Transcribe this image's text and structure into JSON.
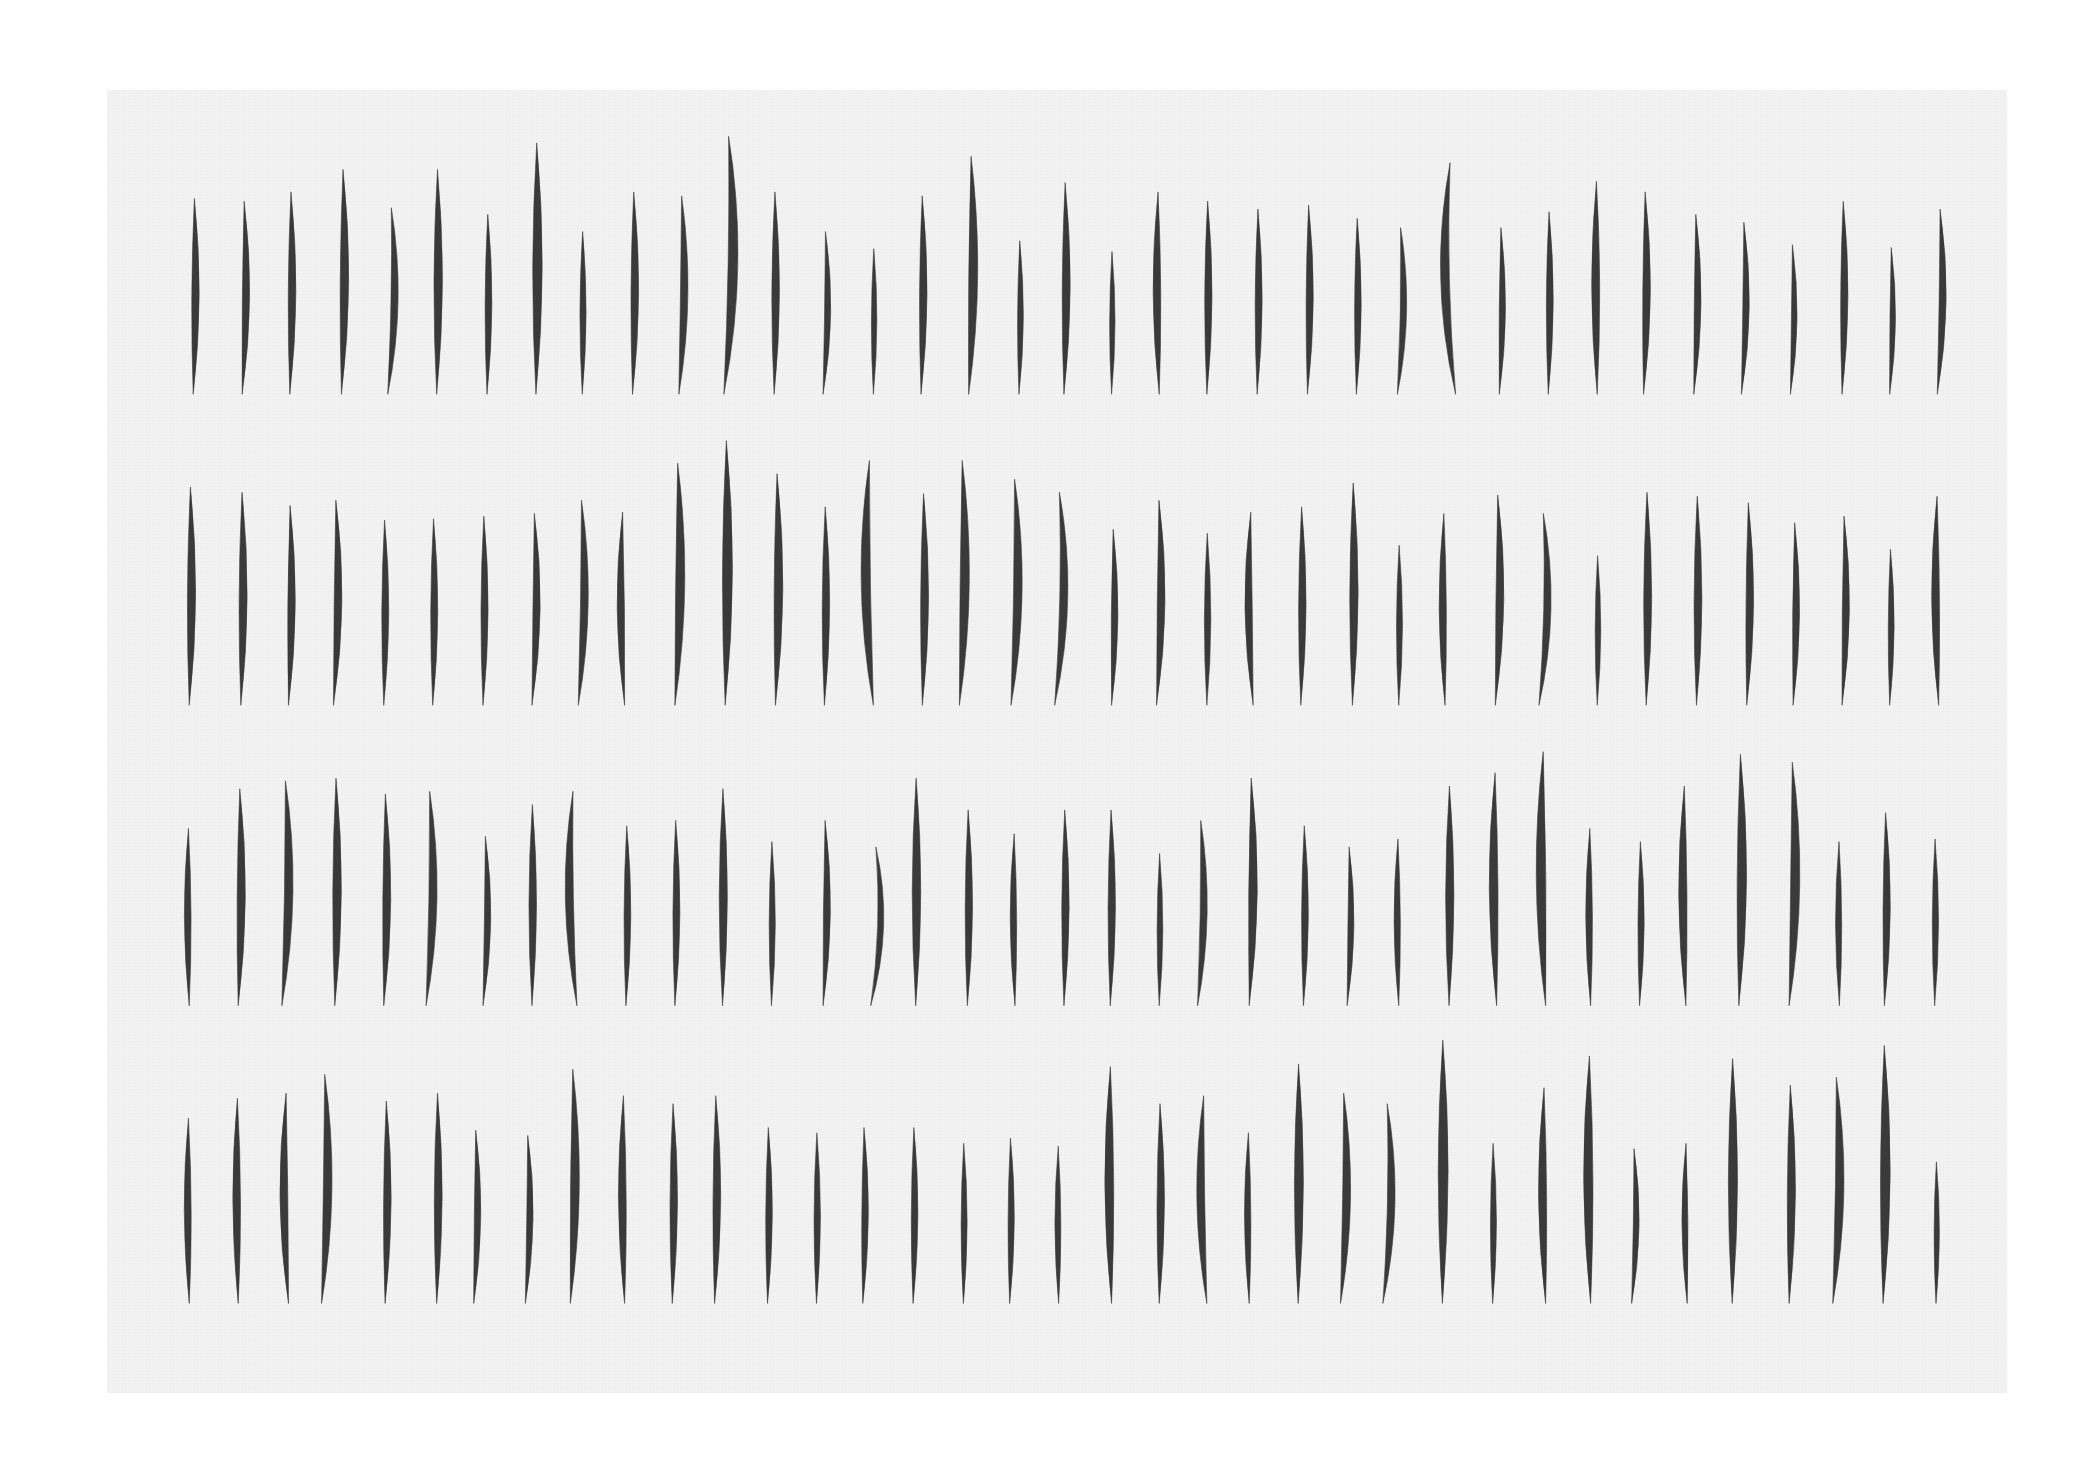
{
  "artwork": {
    "paper": {
      "x": 107,
      "y": 90,
      "width": 1900,
      "height": 1303,
      "color": "#f3f3f3"
    },
    "stroke_color": "#3a3a3a",
    "scale_from_overview": 1.3233,
    "rows": [
      {
        "bottom": 298,
        "strokes": [
          [
            146,
            150,
            3
          ],
          [
            183,
            152,
            5
          ],
          [
            219,
            145,
            3
          ],
          [
            258,
            128,
            4
          ],
          [
            293,
            157,
            9
          ],
          [
            330,
            128,
            2
          ],
          [
            368,
            162,
            2
          ],
          [
            405,
            108,
            2
          ],
          [
            440,
            175,
            1
          ],
          [
            478,
            145,
            3
          ],
          [
            513,
            148,
            7
          ],
          [
            547,
            103,
            12
          ],
          [
            585,
            145,
            2
          ],
          [
            622,
            175,
            6
          ],
          [
            660,
            188,
            1
          ],
          [
            696,
            148,
            3
          ],
          [
            732,
            118,
            6
          ],
          [
            770,
            182,
            2
          ],
          [
            804,
            138,
            3
          ],
          [
            840,
            190,
            1
          ],
          [
            876,
            145,
            -3
          ],
          [
            912,
            152,
            2
          ],
          [
            950,
            158,
            2
          ],
          [
            988,
            155,
            3
          ],
          [
            1025,
            165,
            2
          ],
          [
            1056,
            172,
            8
          ],
          [
            1100,
            123,
            -14
          ],
          [
            1133,
            172,
            4
          ],
          [
            1170,
            160,
            2
          ],
          [
            1207,
            137,
            -2
          ],
          [
            1242,
            145,
            4
          ],
          [
            1280,
            162,
            5
          ],
          [
            1316,
            168,
            6
          ],
          [
            1353,
            185,
            5
          ],
          [
            1392,
            152,
            3
          ],
          [
            1428,
            187,
            4
          ],
          [
            1464,
            158,
            7
          ]
        ]
      },
      {
        "bottom": 533,
        "strokes": [
          [
            143,
            368,
            3
          ],
          [
            182,
            372,
            3
          ],
          [
            218,
            382,
            4
          ],
          [
            252,
            378,
            6
          ],
          [
            290,
            393,
            2
          ],
          [
            327,
            392,
            2
          ],
          [
            365,
            390,
            2
          ],
          [
            402,
            388,
            6
          ],
          [
            437,
            378,
            8
          ],
          [
            472,
            387,
            -5
          ],
          [
            510,
            350,
            7
          ],
          [
            548,
            333,
            3
          ],
          [
            586,
            358,
            4
          ],
          [
            623,
            383,
            2
          ],
          [
            660,
            348,
            -10
          ],
          [
            697,
            373,
            3
          ],
          [
            725,
            348,
            7
          ],
          [
            764,
            362,
            9
          ],
          [
            797,
            372,
            12
          ],
          [
            840,
            400,
            4
          ],
          [
            874,
            378,
            6
          ],
          [
            912,
            403,
            1
          ],
          [
            947,
            387,
            -6
          ],
          [
            983,
            383,
            2
          ],
          [
            1022,
            365,
            2
          ],
          [
            1057,
            412,
            1
          ],
          [
            1092,
            388,
            -3
          ],
          [
            1130,
            374,
            6
          ],
          [
            1163,
            388,
            11
          ],
          [
            1207,
            420,
            1
          ],
          [
            1244,
            372,
            2
          ],
          [
            1282,
            375,
            2
          ],
          [
            1320,
            380,
            4
          ],
          [
            1355,
            395,
            4
          ],
          [
            1392,
            390,
            5
          ],
          [
            1428,
            415,
            2
          ],
          [
            1465,
            375,
            -4
          ]
        ]
      },
      {
        "bottom": 760,
        "strokes": [
          [
            143,
            626,
            -2
          ],
          [
            180,
            596,
            4
          ],
          [
            213,
            590,
            9
          ],
          [
            253,
            588,
            3
          ],
          [
            290,
            600,
            4
          ],
          [
            322,
            598,
            9
          ],
          [
            365,
            632,
            6
          ],
          [
            402,
            608,
            1
          ],
          [
            436,
            598,
            -10
          ],
          [
            473,
            624,
            2
          ],
          [
            510,
            620,
            2
          ],
          [
            546,
            596,
            1
          ],
          [
            583,
            636,
            1
          ],
          [
            622,
            620,
            5
          ],
          [
            658,
            640,
            13
          ],
          [
            692,
            588,
            1
          ],
          [
            731,
            612,
            2
          ],
          [
            767,
            630,
            -2
          ],
          [
            804,
            612,
            2
          ],
          [
            839,
            612,
            2
          ],
          [
            876,
            645,
            1
          ],
          [
            905,
            620,
            8
          ],
          [
            944,
            588,
            5
          ],
          [
            985,
            624,
            2
          ],
          [
            1018,
            640,
            5
          ],
          [
            1057,
            634,
            -2
          ],
          [
            1095,
            594,
            1
          ],
          [
            1131,
            584,
            -4
          ],
          [
            1168,
            568,
            -6
          ],
          [
            1202,
            626,
            -2
          ],
          [
            1239,
            636,
            2
          ],
          [
            1274,
            594,
            -4
          ],
          [
            1314,
            570,
            4
          ],
          [
            1352,
            576,
            8
          ],
          [
            1390,
            636,
            -1
          ],
          [
            1424,
            614,
            3
          ],
          [
            1462,
            634,
            1
          ]
        ]
      },
      {
        "bottom": 985,
        "strokes": [
          [
            143,
            845,
            -2
          ],
          [
            180,
            830,
            -2
          ],
          [
            218,
            826,
            -6
          ],
          [
            243,
            812,
            8
          ],
          [
            291,
            832,
            3
          ],
          [
            330,
            826,
            2
          ],
          [
            358,
            854,
            5
          ],
          [
            397,
            858,
            6
          ],
          [
            431,
            808,
            6
          ],
          [
            472,
            828,
            -3
          ],
          [
            508,
            834,
            2
          ],
          [
            540,
            828,
            3
          ],
          [
            580,
            852,
            2
          ],
          [
            617,
            856,
            1
          ],
          [
            652,
            852,
            3
          ],
          [
            690,
            852,
            2
          ],
          [
            728,
            864,
            1
          ],
          [
            763,
            860,
            2
          ],
          [
            800,
            866,
            -1
          ],
          [
            840,
            806,
            -3
          ],
          [
            876,
            834,
            2
          ],
          [
            912,
            828,
            -8
          ],
          [
            944,
            856,
            -2
          ],
          [
            981,
            804,
            1
          ],
          [
            1013,
            826,
            8
          ],
          [
            1045,
            834,
            11
          ],
          [
            1090,
            786,
            1
          ],
          [
            1128,
            864,
            1
          ],
          [
            1168,
            822,
            -4
          ],
          [
            1202,
            798,
            -3
          ],
          [
            1233,
            868,
            6
          ],
          [
            1275,
            864,
            -3
          ],
          [
            1309,
            800,
            1
          ],
          [
            1352,
            820,
            3
          ],
          [
            1385,
            814,
            9
          ],
          [
            1423,
            790,
            3
          ],
          [
            1463,
            878,
            1
          ]
        ]
      }
    ]
  }
}
